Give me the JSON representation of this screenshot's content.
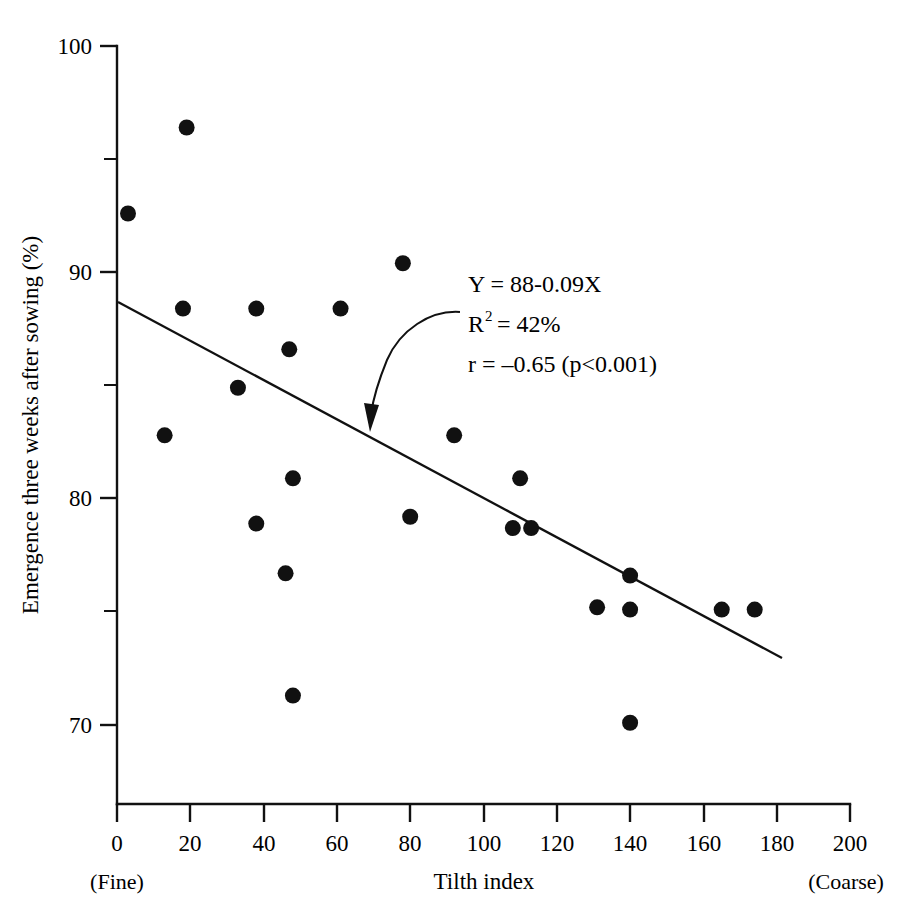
{
  "chart_data": {
    "type": "scatter",
    "title": "",
    "xlabel": "Tilth index",
    "ylabel": "Emergence three weeks after sowing (%)",
    "xlim": [
      0,
      200
    ],
    "ylim": [
      66,
      100
    ],
    "grid": false,
    "legend": "none",
    "x_ticks": [
      0,
      20,
      40,
      60,
      80,
      100,
      120,
      140,
      160,
      180,
      200
    ],
    "x_tick_labels": [
      "0",
      "20",
      "40",
      "60",
      "80",
      "100",
      "120",
      "140",
      "160",
      "180",
      "200"
    ],
    "y_ticks": [
      70,
      80,
      90,
      100
    ],
    "y_tick_labels": [
      "70",
      "80",
      "90",
      "100"
    ],
    "y_minor_ticks": [
      75,
      85,
      95
    ],
    "x_axis_left_note": "(Fine)",
    "x_axis_right_note": "(Coarse)",
    "points": [
      {
        "x": 3,
        "y": 92.6
      },
      {
        "x": 19,
        "y": 96.4
      },
      {
        "x": 13,
        "y": 82.8
      },
      {
        "x": 18,
        "y": 88.4
      },
      {
        "x": 33,
        "y": 84.9
      },
      {
        "x": 38,
        "y": 88.4
      },
      {
        "x": 38,
        "y": 78.9
      },
      {
        "x": 47,
        "y": 86.6
      },
      {
        "x": 46,
        "y": 76.7
      },
      {
        "x": 48,
        "y": 80.9
      },
      {
        "x": 48,
        "y": 71.3
      },
      {
        "x": 61,
        "y": 88.4
      },
      {
        "x": 78,
        "y": 90.4
      },
      {
        "x": 80,
        "y": 79.2
      },
      {
        "x": 92,
        "y": 82.8
      },
      {
        "x": 108,
        "y": 78.7
      },
      {
        "x": 110,
        "y": 80.9
      },
      {
        "x": 113,
        "y": 78.7
      },
      {
        "x": 131,
        "y": 75.2
      },
      {
        "x": 140,
        "y": 76.6
      },
      {
        "x": 140,
        "y": 75.1
      },
      {
        "x": 140,
        "y": 70.1
      },
      {
        "x": 165,
        "y": 75.1
      },
      {
        "x": 174,
        "y": 75.1
      }
    ],
    "fit_line": {
      "type": "linear",
      "intercept": 88,
      "slope": -0.09,
      "x_start": 0,
      "x_end": 181
    },
    "annotations": {
      "equation": "Y = 88-0.09X",
      "r_squared_base": "R",
      "r_squared_exp": "2",
      "r_squared_value": "= 42%",
      "correlation": "r = –0.65 (p<0.001)"
    },
    "marker": {
      "shape": "circle",
      "color": "#111111",
      "radius_px": 8
    }
  }
}
